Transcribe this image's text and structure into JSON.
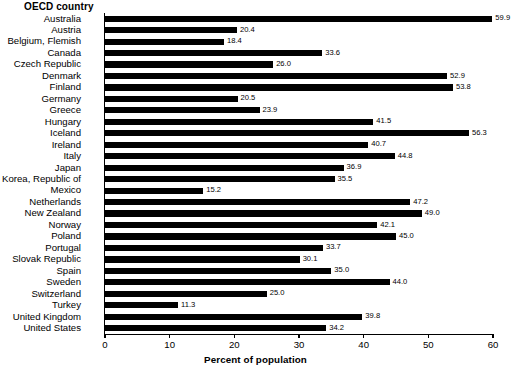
{
  "chart_data": {
    "type": "bar",
    "orientation": "horizontal",
    "title": "",
    "ylabel": "OECD country",
    "xlabel": "Percent of population",
    "xlim": [
      0,
      60
    ],
    "xticks": [
      0,
      10,
      20,
      30,
      40,
      50,
      60
    ],
    "grid": false,
    "legend": null,
    "bar_color": "#000000",
    "background_color": "#FFFFFF",
    "show_value_labels": true,
    "categories": [
      "Australia",
      "Austria",
      "Belgium, Flemish",
      "Canada",
      "Czech Republic",
      "Denmark",
      "Finland",
      "Germany",
      "Greece",
      "Hungary",
      "Iceland",
      "Ireland",
      "Italy",
      "Japan",
      "Korea, Republic of",
      "Mexico",
      "Netherlands",
      "New Zealand",
      "Norway",
      "Poland",
      "Portugal",
      "Slovak Republic",
      "Spain",
      "Sweden",
      "Switzerland",
      "Turkey",
      "United Kingdom",
      "United States"
    ],
    "values": [
      59.9,
      20.4,
      18.4,
      33.6,
      26.0,
      52.9,
      53.8,
      20.5,
      23.9,
      41.5,
      56.3,
      40.7,
      44.8,
      36.9,
      35.5,
      15.2,
      47.2,
      49.0,
      42.1,
      45.0,
      33.7,
      30.1,
      35.0,
      44.0,
      25.0,
      11.3,
      39.8,
      34.2
    ],
    "value_labels": [
      "59.9",
      "20.4",
      "18.4",
      "33.6",
      "26.0",
      "52.9",
      "53.8",
      "20.5",
      "23.9",
      "41.5",
      "56.3",
      "40.7",
      "44.8",
      "36.9",
      "35.5",
      "15.2",
      "47.2",
      "49.0",
      "42.1",
      "45.0",
      "33.7",
      "30.1",
      "35.0",
      "44.0",
      "25.0",
      "11.3",
      "39.8",
      "34.2"
    ],
    "xtick_labels": [
      "0",
      "10",
      "20",
      "30",
      "40",
      "50",
      "60"
    ]
  }
}
